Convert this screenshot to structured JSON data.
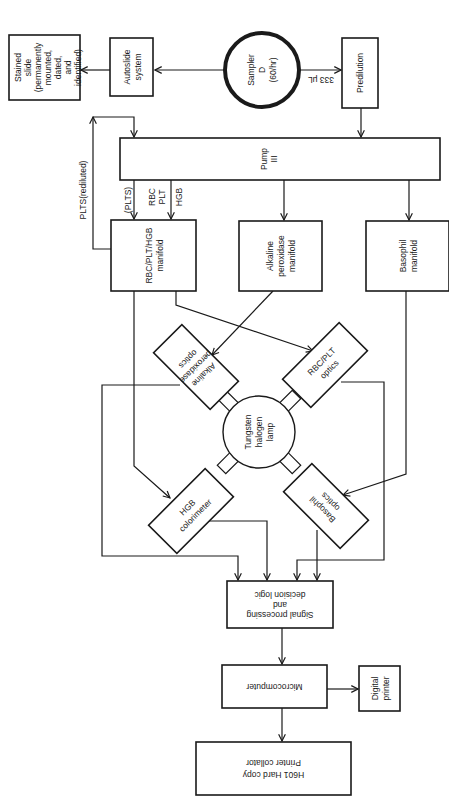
{
  "diagram": {
    "title": "",
    "orientation": "rotated 90 degrees clockwise (text reads top-to-bottom)",
    "colors": {
      "ink": "#1a1a1a",
      "background": "#ffffff"
    },
    "nodes": {
      "stained_slide": {
        "lines": [
          "Stained",
          "slide",
          "(permanently",
          "mounted,",
          "dated,",
          "and",
          "identified)"
        ]
      },
      "autoslide": {
        "lines": [
          "Autoslide",
          "system"
        ]
      },
      "sampler": {
        "lines": [
          "Sampler",
          "D",
          "(60/hr)"
        ]
      },
      "predilution": {
        "lines": [
          "Predilution"
        ]
      },
      "pump": {
        "lines": [
          "Pump",
          "III"
        ]
      },
      "rbc_manifold": {
        "lines": [
          "RBC/PLT/HGB",
          "manifold"
        ]
      },
      "alk_manifold": {
        "lines": [
          "Alkaline",
          "peroxidase",
          "manifold"
        ]
      },
      "baso_manifold": {
        "lines": [
          "Basophil",
          "manifold"
        ]
      },
      "lamp": {
        "lines": [
          "Tungsten",
          "halogen",
          "lamp"
        ]
      },
      "alk_optics": {
        "lines": [
          "Alkaline",
          "peroxidase",
          "optics"
        ]
      },
      "rbc_optics": {
        "lines": [
          "RBC/PLT",
          "optics"
        ]
      },
      "hgb_colorimeter": {
        "lines": [
          "HGB",
          "colorimeter"
        ]
      },
      "baso_optics": {
        "lines": [
          "Basophil",
          "optics"
        ]
      },
      "signal": {
        "lines": [
          "Signal processing",
          "and",
          "decision logic"
        ]
      },
      "microcomputer": {
        "lines": [
          "Microcomputer"
        ]
      },
      "digital_printer": {
        "lines": [
          "Digital",
          "printer"
        ]
      },
      "hardcopy": {
        "lines": [
          "H601    Hard copy",
          "Printer collator"
        ]
      }
    },
    "edge_labels": {
      "to_autoslide": "350 μL",
      "to_predilution": "333 μL",
      "plts_rediluted": "PLTS(rediluted)",
      "plts": "(PLTS)",
      "rbc_plt": [
        "RBC",
        "PLT"
      ],
      "hgb": "HGB"
    },
    "edges": [
      [
        "sampler",
        "autoslide"
      ],
      [
        "autoslide",
        "stained_slide"
      ],
      [
        "sampler",
        "predilution"
      ],
      [
        "predilution",
        "pump"
      ],
      [
        "pump",
        "rbc_manifold"
      ],
      [
        "pump",
        "alk_manifold"
      ],
      [
        "pump",
        "baso_manifold"
      ],
      [
        "rbc_manifold",
        "pump"
      ],
      [
        "rbc_manifold",
        "rbc_optics"
      ],
      [
        "rbc_manifold",
        "hgb_colorimeter"
      ],
      [
        "alk_manifold",
        "alk_optics"
      ],
      [
        "baso_manifold",
        "baso_optics"
      ],
      [
        "alk_optics",
        "signal"
      ],
      [
        "hgb_colorimeter",
        "signal"
      ],
      [
        "rbc_optics",
        "signal"
      ],
      [
        "baso_optics",
        "signal"
      ],
      [
        "signal",
        "microcomputer"
      ],
      [
        "microcomputer",
        "digital_printer"
      ],
      [
        "microcomputer",
        "hardcopy"
      ]
    ]
  }
}
